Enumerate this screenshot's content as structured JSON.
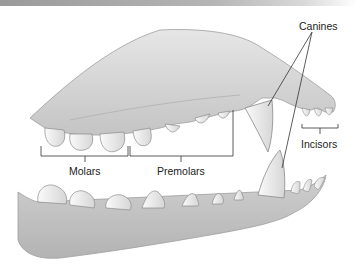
{
  "diagram": {
    "labels": {
      "canines": "Canines",
      "incisors": "Incisors",
      "molars": "Molars",
      "premolars": "Premolars"
    },
    "colors": {
      "gum": "#d4d4d4",
      "gum_shadow": "#b8b8b8",
      "tooth": "#ececec",
      "tooth_outline": "#8a8a8a",
      "leader_line": "#333333",
      "background": "#ffffff"
    }
  }
}
